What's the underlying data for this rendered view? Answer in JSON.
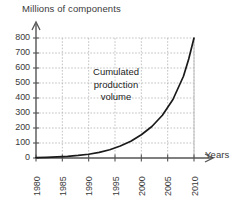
{
  "chart_data": {
    "type": "line",
    "title": "",
    "xlabel": "Years",
    "ylabel": "Millions of components",
    "annotation": "Cumulated\nproduction\nvolume",
    "grid": true,
    "legend": "none",
    "xlim": [
      1980,
      2010
    ],
    "ylim": [
      0,
      800
    ],
    "xticks": [
      "1980",
      "1985",
      "1990",
      "1995",
      "2000",
      "2005",
      "2010"
    ],
    "yticks": [
      "0",
      "100",
      "200",
      "300",
      "400",
      "500",
      "600",
      "700",
      "800"
    ],
    "xtick_values": [
      1980,
      1985,
      1990,
      1995,
      2000,
      2005,
      2010
    ],
    "ytick_values": [
      0,
      100,
      200,
      300,
      400,
      500,
      600,
      700,
      800
    ],
    "series": [
      {
        "name": "Cumulated production volume",
        "color": "#1a1a1a",
        "x": [
          1980,
          1982,
          1984,
          1986,
          1988,
          1990,
          1992,
          1994,
          1996,
          1998,
          2000,
          2002,
          2004,
          2006,
          2008,
          2009,
          2010
        ],
        "values": [
          2,
          4,
          7,
          11,
          17,
          25,
          38,
          55,
          80,
          112,
          155,
          210,
          285,
          390,
          545,
          660,
          800
        ]
      }
    ]
  },
  "axis_titles": {
    "y": "Millions of components",
    "x": "Years"
  },
  "colors": {
    "curve": "#1a1a1a",
    "axis": "#555555",
    "grid": "#b4b4b4",
    "text": "#3a3a3a"
  }
}
